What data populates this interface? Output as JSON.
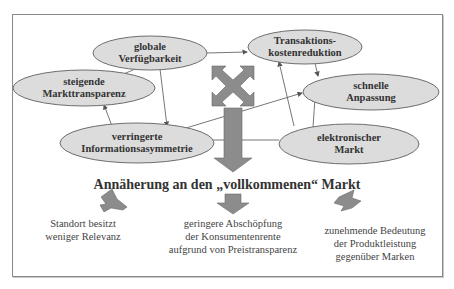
{
  "diagram": {
    "nodes": [
      {
        "id": "globale-verfuegbarkeit",
        "lines": [
          "globale",
          "Verfügbarkeit"
        ]
      },
      {
        "id": "transaktionskostenreduktion",
        "lines": [
          "Transaktions-",
          "kostenreduktion"
        ]
      },
      {
        "id": "steigende-markttransparenz",
        "lines": [
          "steigende",
          "Markttransparenz"
        ]
      },
      {
        "id": "schnelle-anpassung",
        "lines": [
          "schnelle",
          "Anpassung"
        ]
      },
      {
        "id": "verringerte-informationsasymmetrie",
        "lines": [
          "verringerte",
          "Informationsasymmetrie"
        ]
      },
      {
        "id": "elektronischer-markt",
        "lines": [
          "elektronischer",
          "Markt"
        ]
      }
    ],
    "edges": [
      {
        "from": "globale-verfuegbarkeit",
        "to": "transaktionskostenreduktion"
      },
      {
        "from": "globale-verfuegbarkeit",
        "to": "steigende-markttransparenz"
      },
      {
        "from": "globale-verfuegbarkeit",
        "to": "verringerte-informationsasymmetrie"
      },
      {
        "from": "verringerte-informationsasymmetrie",
        "to": "steigende-markttransparenz"
      },
      {
        "from": "verringerte-informationsasymmetrie",
        "to": "schnelle-anpassung"
      },
      {
        "from": "transaktionskostenreduktion",
        "to": "schnelle-anpassung"
      },
      {
        "from": "elektronischer-markt",
        "to": "transaktionskostenreduktion"
      },
      {
        "from": "elektronischer-markt",
        "to": "schnelle-anpassung"
      },
      {
        "from": "elektronischer-markt",
        "to": "verringerte-informationsasymmetrie"
      }
    ],
    "headline": "Annäherung an den „vollkommenen“ Markt",
    "outcomes": [
      {
        "lines": [
          "Standort besitzt",
          "weniger Relevanz"
        ]
      },
      {
        "lines": [
          "geringere Abschöpfung",
          "der Konsumentenrente",
          "aufgrund von Preistransparenz"
        ]
      },
      {
        "lines": [
          "zunehmende Bedeutung",
          "der Produktleistung",
          "gegenüber Marken"
        ]
      }
    ],
    "colors": {
      "ellipse_fill": "#dcdcdc",
      "ellipse_stroke": "#6e6e6e",
      "arrow_fill": "#8c8c8c",
      "text": "#333333",
      "frame": "#8a8a8a"
    }
  }
}
